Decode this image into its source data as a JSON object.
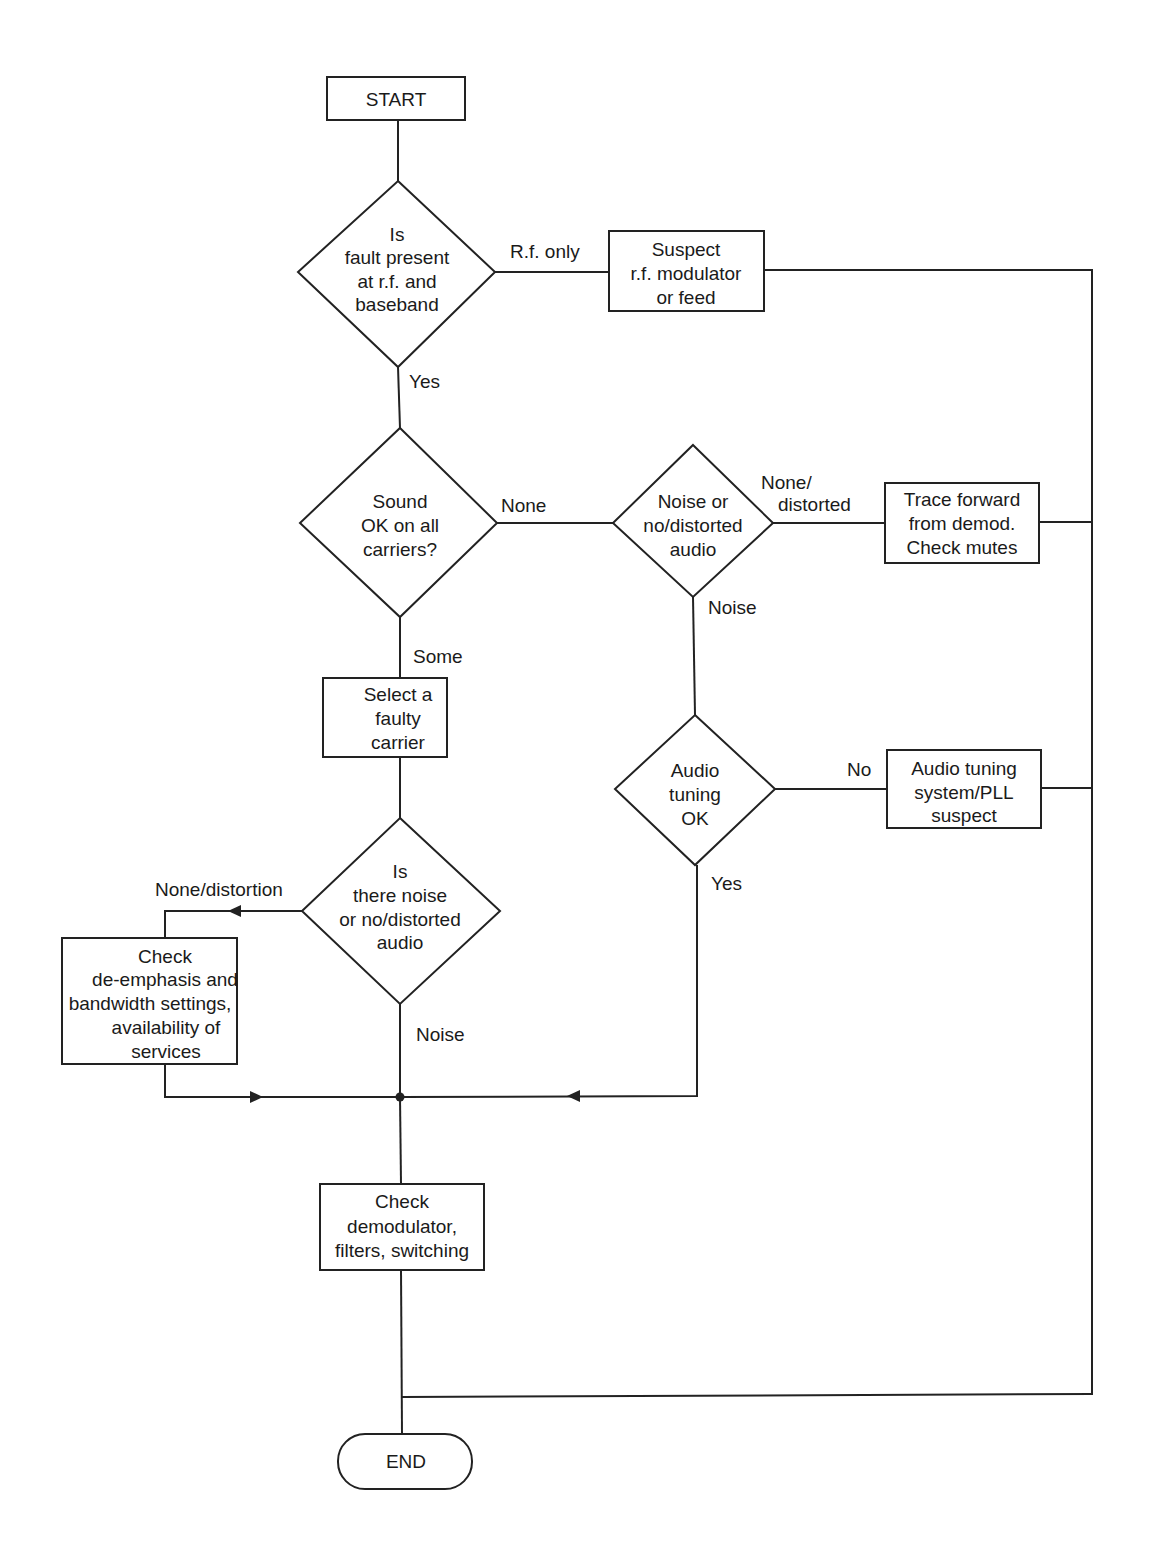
{
  "diagram": {
    "type": "flowchart",
    "nodes": {
      "start": {
        "label": [
          "START"
        ],
        "shape": "rect"
      },
      "d_fault": {
        "label": [
          "Is",
          "fault present",
          "at r.f. and",
          "baseband"
        ],
        "shape": "diamond"
      },
      "suspect_rf": {
        "label": [
          "Suspect",
          "r.f. modulator",
          "or feed"
        ],
        "shape": "rect"
      },
      "d_sound": {
        "label": [
          "Sound",
          "OK on all",
          "carriers?"
        ],
        "shape": "diamond"
      },
      "d_noise_none": {
        "label": [
          "Noise or",
          "no/distorted",
          "audio"
        ],
        "shape": "diamond"
      },
      "trace_forward": {
        "label": [
          "Trace forward",
          "from demod.",
          "Check mutes"
        ],
        "shape": "rect"
      },
      "select_carrier": {
        "label": [
          "Select a",
          "faulty",
          "carrier"
        ],
        "shape": "rect"
      },
      "d_audio_tuning": {
        "label": [
          "Audio",
          "tuning",
          "OK"
        ],
        "shape": "diamond"
      },
      "audio_tuning_suspect": {
        "label": [
          "Audio tuning",
          "system/PLL",
          "suspect"
        ],
        "shape": "rect"
      },
      "d_is_noise": {
        "label": [
          "Is",
          "there noise",
          "or no/distorted",
          "audio"
        ],
        "shape": "diamond"
      },
      "check_deemphasis": {
        "label": [
          "Check",
          "de-emphasis and",
          "bandwidth settings,",
          "availability of",
          "services"
        ],
        "shape": "rect"
      },
      "check_demod": {
        "label": [
          "Check",
          "demodulator,",
          "filters, switching"
        ],
        "shape": "rect"
      },
      "end": {
        "label": [
          "END"
        ],
        "shape": "terminal"
      }
    },
    "edge_labels": {
      "rf_only": "R.f. only",
      "yes_1": "Yes",
      "none_1": "None",
      "none_distorted_1": "None/",
      "none_distorted_2": "distorted",
      "noise_1": "Noise",
      "some": "Some",
      "no": "No",
      "yes_2": "Yes",
      "none_distortion": "None/distortion",
      "noise_2": "Noise"
    },
    "edges": [
      {
        "from": "start",
        "to": "d_fault",
        "label": ""
      },
      {
        "from": "d_fault",
        "to": "suspect_rf",
        "label": "R.f. only"
      },
      {
        "from": "d_fault",
        "to": "d_sound",
        "label": "Yes"
      },
      {
        "from": "suspect_rf",
        "to": "end",
        "label": ""
      },
      {
        "from": "d_sound",
        "to": "d_noise_none",
        "label": "None"
      },
      {
        "from": "d_sound",
        "to": "select_carrier",
        "label": "Some"
      },
      {
        "from": "d_noise_none",
        "to": "trace_forward",
        "label": "None/ distorted"
      },
      {
        "from": "d_noise_none",
        "to": "d_audio_tuning",
        "label": "Noise"
      },
      {
        "from": "trace_forward",
        "to": "end",
        "label": ""
      },
      {
        "from": "d_audio_tuning",
        "to": "audio_tuning_suspect",
        "label": "No"
      },
      {
        "from": "d_audio_tuning",
        "to": "check_demod",
        "label": "Yes"
      },
      {
        "from": "audio_tuning_suspect",
        "to": "end",
        "label": ""
      },
      {
        "from": "select_carrier",
        "to": "d_is_noise",
        "label": ""
      },
      {
        "from": "d_is_noise",
        "to": "check_deemphasis",
        "label": "None/distortion"
      },
      {
        "from": "d_is_noise",
        "to": "check_demod",
        "label": "Noise"
      },
      {
        "from": "check_deemphasis",
        "to": "check_demod",
        "label": ""
      },
      {
        "from": "check_demod",
        "to": "end",
        "label": ""
      }
    ],
    "colors": {
      "stroke": "#222222",
      "text": "#1a1a1a",
      "background": "#ffffff"
    }
  }
}
